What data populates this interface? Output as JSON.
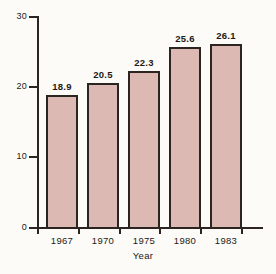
{
  "chart_data": {
    "type": "bar",
    "title": "",
    "subtitle": "",
    "xlabel": "Year",
    "ylabel": "",
    "categories": [
      "1967",
      "1970",
      "1975",
      "1980",
      "1983"
    ],
    "values": [
      18.9,
      20.5,
      22.3,
      25.6,
      26.1
    ],
    "value_labels": [
      "18.9",
      "20.5",
      "22.3",
      "25.6",
      "26.1"
    ],
    "series": [
      {
        "name": "",
        "values": [
          18.9,
          20.5,
          22.3,
          25.6,
          26.1
        ]
      }
    ],
    "ylim": [
      0,
      30
    ],
    "xlim": null,
    "y_ticks": [
      0,
      10,
      20,
      30
    ],
    "y_tick_labels": [
      "0",
      "10",
      "20",
      "30"
    ],
    "grid": false,
    "legend": false,
    "legend_position": "none",
    "annotations": [],
    "colors": {
      "bar_fill": "#ddb9b3",
      "bar_border": "#2b2420",
      "axis": "#2b2420",
      "text": "#1c1916",
      "background": "#fcfbf7"
    }
  }
}
